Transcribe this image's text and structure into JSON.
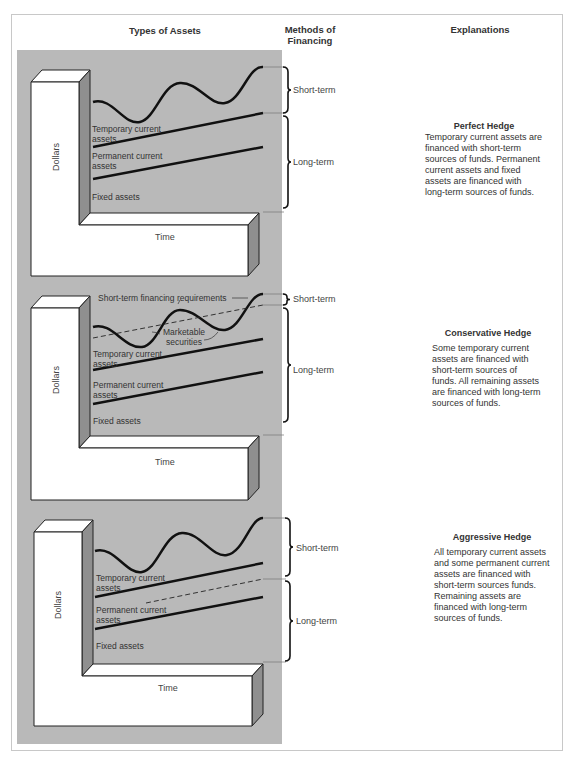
{
  "headers": {
    "types_of_assets": "Types of Assets",
    "methods_of_financing_line1": "Methods of",
    "methods_of_financing_line2": "Financing",
    "explanations": "Explanations"
  },
  "axes": {
    "y_label": "Dollars",
    "x_label": "Time"
  },
  "asset_labels": {
    "temporary_line1": "Temporary current",
    "temporary_line2": "assets",
    "permanent_line1": "Permanent current",
    "permanent_line2": "assets",
    "fixed": "Fixed assets"
  },
  "financing": {
    "short_term": "Short-term",
    "long_term": "Long-term"
  },
  "panels": [
    {
      "title": "Perfect Hedge",
      "explanation": "Temporary current assets are financed with short-term sources of funds. Permanent current assets and fixed assets are financed with long-term sources of funds."
    },
    {
      "title": "Conservative Hedge",
      "explanation": "Some temporary current assets are financed with short-term sources of funds. All remaining assets are financed with long-term sources of funds.",
      "annotation_short_term_req": "Short-term financing requirements",
      "annotation_marketable_line1": "Marketable",
      "annotation_marketable_line2": "securities"
    },
    {
      "title": "Aggressive Hedge",
      "explanation": "All temporary current assets and some permanent current assets are financed with short-term sources funds. Remaining assets are financed with long-term sources of funds."
    }
  ],
  "colors": {
    "panel_gray": "#b9b9b9",
    "block_face": "#ffffff",
    "block_side": "#8f8f8f",
    "line": "#111111"
  }
}
